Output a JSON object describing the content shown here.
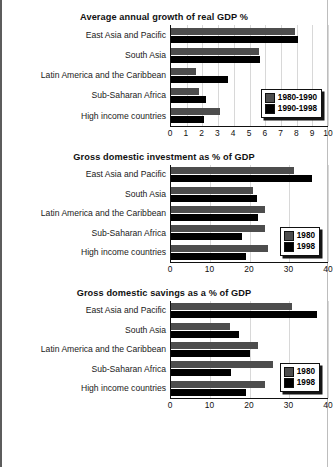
{
  "chart_data": [
    {
      "type": "bar",
      "orientation": "horizontal",
      "title": "Average annual growth of real GDP %",
      "xlabel": "",
      "ylabel": "",
      "xlim": [
        0,
        10
      ],
      "xticks": [
        "0",
        "1",
        "2",
        "3",
        "4",
        "5",
        "6",
        "7",
        "8",
        "9",
        "10"
      ],
      "grid": true,
      "legend_position": "inside-lower-right",
      "categories": [
        "East Asia and Pacific",
        "South Asia",
        "Latin America and the Caribbean",
        "Sub-Saharan Africa",
        "High income countries"
      ],
      "series": [
        {
          "name": "1980-1990",
          "color": "#4d4d4d",
          "values": [
            7.9,
            5.6,
            1.6,
            1.8,
            3.1
          ]
        },
        {
          "name": "1990-1998",
          "color": "#000000",
          "values": [
            8.1,
            5.7,
            3.6,
            2.2,
            2.1
          ]
        }
      ]
    },
    {
      "type": "bar",
      "orientation": "horizontal",
      "title": "Gross domestic investment as % of GDP",
      "xlabel": "",
      "ylabel": "",
      "xlim": [
        0,
        40
      ],
      "xticks": [
        "0",
        "10",
        "20",
        "30",
        "40"
      ],
      "grid": true,
      "legend_position": "inside-lower-right",
      "categories": [
        "East Asia and Pacific",
        "South Asia",
        "Latin America and the Caribbean",
        "Sub-Saharan Africa",
        "High income countries"
      ],
      "series": [
        {
          "name": "1980",
          "color": "#4d4d4d",
          "values": [
            31.4,
            20.8,
            24.0,
            24.0,
            24.8
          ]
        },
        {
          "name": "1998",
          "color": "#000000",
          "values": [
            36.0,
            22.0,
            22.2,
            18.2,
            19.0
          ]
        }
      ]
    },
    {
      "type": "bar",
      "orientation": "horizontal",
      "title": "Gross domestic savings as a % of GDP",
      "xlabel": "",
      "ylabel": "",
      "xlim": [
        0,
        40
      ],
      "xticks": [
        "0",
        "10",
        "20",
        "30",
        "40"
      ],
      "grid": true,
      "legend_position": "inside-lower-right",
      "categories": [
        "East Asia and Pacific",
        "South Asia",
        "Latin America and the Caribbean",
        "Sub-Saharan Africa",
        "High income countries"
      ],
      "series": [
        {
          "name": "1980",
          "color": "#4d4d4d",
          "values": [
            30.8,
            15.0,
            22.2,
            26.0,
            24.0
          ]
        },
        {
          "name": "1998",
          "color": "#000000",
          "values": [
            37.2,
            17.2,
            20.2,
            15.2,
            19.2
          ]
        }
      ]
    }
  ]
}
